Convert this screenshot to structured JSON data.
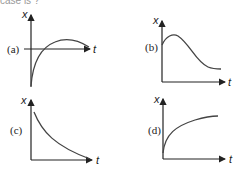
{
  "caption_fragment": "case is ?",
  "panels": [
    {
      "label": "(a)",
      "x_axis": "t",
      "y_axis": "x",
      "curve": "starts negative, rises through zero, peaks, slightly declines"
    },
    {
      "label": "(b)",
      "x_axis": "t",
      "y_axis": "x",
      "curve": "starts positive, peaks early, decays toward small value"
    },
    {
      "label": "(c)",
      "x_axis": "t",
      "y_axis": "x",
      "curve": "exponential decay from high value toward zero"
    },
    {
      "label": "(d)",
      "x_axis": "t",
      "y_axis": "x",
      "curve": "starts near zero, rises quickly then saturates"
    }
  ],
  "colors": {
    "curve": "#444444",
    "axis": "#222222"
  }
}
